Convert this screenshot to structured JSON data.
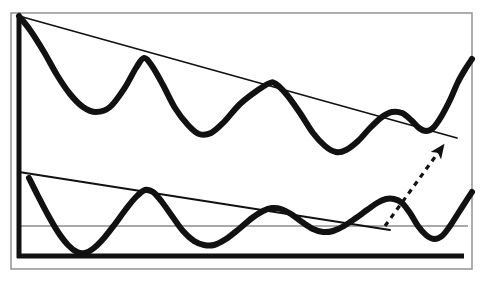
{
  "figure": {
    "kind": "technical-analysis-line-chart",
    "title": "",
    "background_color": "#ffffff",
    "ink_color": "#111111",
    "frame_color": "#8a8a8a",
    "thin_line_color": "#555555"
  },
  "chart_data": {
    "type": "line",
    "title": "",
    "subtitle": "",
    "xlabel": "",
    "ylabel": "",
    "grid": false,
    "legend": "none",
    "xlim": [
      0,
      487
    ],
    "ylim": [
      282,
      0
    ],
    "axis_frame": {
      "outer_border": {
        "x": 11,
        "y": 13,
        "width": 461,
        "height": 256,
        "stroke": "#8a8a8a",
        "stroke_width": 1.4
      },
      "y_axis": {
        "x1": 19,
        "y1": 15,
        "x2": 19,
        "y2": 258,
        "stroke": "#111111",
        "stroke_width": 5
      },
      "x_axis": {
        "x1": 17,
        "y1": 256,
        "x2": 464,
        "y2": 256,
        "stroke": "#111111",
        "stroke_width": 5
      }
    },
    "series": [
      {
        "name": "upper-oscillating-price-wave",
        "style": "thick-solid",
        "stroke": "#111111",
        "stroke_width": 6,
        "points": [
          [
            19,
            16
          ],
          [
            30,
            30
          ],
          [
            44,
            52
          ],
          [
            57,
            75
          ],
          [
            70,
            94
          ],
          [
            83,
            107
          ],
          [
            96,
            112
          ],
          [
            110,
            107
          ],
          [
            124,
            89
          ],
          [
            136,
            68
          ],
          [
            144,
            58
          ],
          [
            152,
            66
          ],
          [
            163,
            85
          ],
          [
            175,
            108
          ],
          [
            188,
            125
          ],
          [
            199,
            134
          ],
          [
            211,
            133
          ],
          [
            224,
            122
          ],
          [
            240,
            104
          ],
          [
            258,
            90
          ],
          [
            270,
            83
          ],
          [
            276,
            84
          ],
          [
            287,
            95
          ],
          [
            300,
            113
          ],
          [
            313,
            133
          ],
          [
            325,
            146
          ],
          [
            336,
            152
          ],
          [
            346,
            150
          ],
          [
            358,
            141
          ],
          [
            370,
            128
          ],
          [
            382,
            117
          ],
          [
            392,
            112
          ],
          [
            402,
            113
          ],
          [
            411,
            120
          ],
          [
            419,
            128
          ],
          [
            426,
            131
          ],
          [
            433,
            128
          ],
          [
            441,
            117
          ],
          [
            450,
            100
          ],
          [
            458,
            82
          ],
          [
            466,
            68
          ],
          [
            472,
            59
          ]
        ]
      },
      {
        "name": "lower-oscillating-indicator-wave",
        "style": "thick-solid",
        "stroke": "#111111",
        "stroke_width": 6,
        "points": [
          [
            29,
            178
          ],
          [
            38,
            196
          ],
          [
            48,
            215
          ],
          [
            58,
            232
          ],
          [
            68,
            245
          ],
          [
            77,
            252
          ],
          [
            85,
            253
          ],
          [
            94,
            248
          ],
          [
            104,
            238
          ],
          [
            115,
            224
          ],
          [
            126,
            209
          ],
          [
            136,
            197
          ],
          [
            145,
            190
          ],
          [
            153,
            192
          ],
          [
            162,
            202
          ],
          [
            172,
            216
          ],
          [
            183,
            231
          ],
          [
            194,
            241
          ],
          [
            204,
            245
          ],
          [
            214,
            245
          ],
          [
            226,
            239
          ],
          [
            239,
            229
          ],
          [
            252,
            218
          ],
          [
            263,
            211
          ],
          [
            272,
            208
          ],
          [
            281,
            209
          ],
          [
            291,
            214
          ],
          [
            302,
            222
          ],
          [
            313,
            229
          ],
          [
            323,
            232
          ],
          [
            333,
            231
          ],
          [
            344,
            226
          ],
          [
            356,
            218
          ],
          [
            367,
            210
          ],
          [
            377,
            203
          ],
          [
            386,
            199
          ],
          [
            394,
            199
          ],
          [
            402,
            203
          ],
          [
            410,
            213
          ],
          [
            418,
            226
          ],
          [
            426,
            235
          ],
          [
            434,
            239
          ],
          [
            442,
            236
          ],
          [
            450,
            226
          ],
          [
            459,
            212
          ],
          [
            468,
            198
          ],
          [
            472,
            192
          ]
        ]
      }
    ],
    "trendlines": [
      {
        "name": "upper-descending-resistance-trendline",
        "style": "thin-solid",
        "stroke": "#111111",
        "stroke_width": 1.8,
        "x1": 19,
        "y1": 16,
        "x2": 457,
        "y2": 138,
        "touches": [
          "wave-peak-1",
          "wave-peak-2",
          "wave-peak-3",
          "wave-peak-4"
        ]
      },
      {
        "name": "lower-descending-resistance-trendline",
        "style": "thin-solid",
        "stroke": "#111111",
        "stroke_width": 1.8,
        "x1": 19,
        "y1": 172,
        "x2": 390,
        "y2": 230,
        "touches": [
          "indicator-peak-1",
          "indicator-peak-2",
          "indicator-peak-3"
        ]
      },
      {
        "name": "horizontal-reference-level",
        "style": "thin-solid",
        "stroke": "#555555",
        "stroke_width": 1.2,
        "x1": 19,
        "y1": 226,
        "x2": 468,
        "y2": 226
      }
    ],
    "annotations": [
      {
        "name": "breakout-arrow",
        "type": "dashed-arrow",
        "stroke": "#111111",
        "stroke_width": 3.2,
        "dash": "5 5",
        "x1": 385,
        "y1": 226,
        "x2": 440,
        "y2": 150,
        "arrowhead": true,
        "label": ""
      }
    ]
  }
}
